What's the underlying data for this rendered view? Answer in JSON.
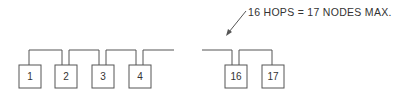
{
  "diagram": {
    "caption": "16 HOPS = 17 NODES MAX.",
    "nodes": [
      {
        "label": "1"
      },
      {
        "label": "2"
      },
      {
        "label": "3"
      },
      {
        "label": "4"
      },
      {
        "label": "16"
      },
      {
        "label": "17"
      }
    ],
    "colors": {
      "line": "#555555",
      "text": "#333333",
      "background": "#ffffff"
    }
  }
}
